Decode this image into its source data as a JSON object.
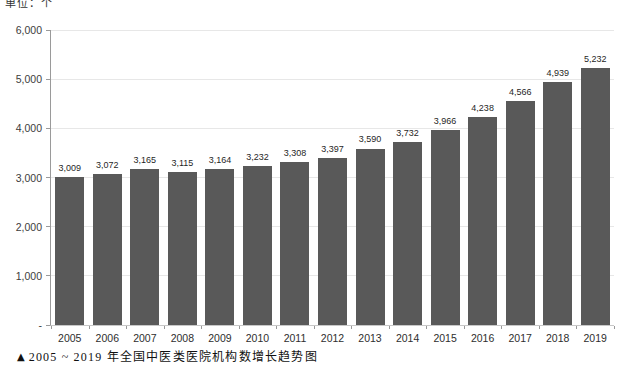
{
  "unit_label": "单位：个",
  "caption": {
    "marker": "▲",
    "text": "2005 ~ 2019 年全国中医类医院机构数增长趋势图"
  },
  "colors": {
    "bar": "#595959",
    "gridline": "#e7e7e7",
    "axis": "#9a9a9a",
    "data_label": "#1f1f1f",
    "background": "#ffffff"
  },
  "chart_data": {
    "type": "bar",
    "title": "",
    "xlabel": "",
    "ylabel": "单位：个",
    "categories": [
      "2005",
      "2006",
      "2007",
      "2008",
      "2009",
      "2010",
      "2011",
      "2012",
      "2013",
      "2014",
      "2015",
      "2016",
      "2017",
      "2018",
      "2019"
    ],
    "values": [
      3009,
      3072,
      3165,
      3115,
      3164,
      3232,
      3308,
      3397,
      3590,
      3732,
      3966,
      4238,
      4566,
      4939,
      5232
    ],
    "data_labels": [
      "3,009",
      "3,072",
      "3,165",
      "3,115",
      "3,164",
      "3,232",
      "3,308",
      "3,397",
      "3,590",
      "3,732",
      "3,966",
      "4,238",
      "4,566",
      "4,939",
      "5,232"
    ],
    "ylim": [
      0,
      6000
    ],
    "ytick_interval": 1000,
    "ytick_labels_top_to_bottom": [
      "6,000",
      "5,000",
      "4,000",
      "3,000",
      "2,000",
      "1,000",
      "-"
    ],
    "grid": true,
    "legend_position": "none"
  }
}
